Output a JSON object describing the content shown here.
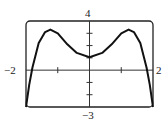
{
  "chart_data": {
    "type": "line",
    "title": "",
    "xlabel": "",
    "ylabel": "",
    "xlim": [
      -2,
      2
    ],
    "ylim": [
      -3,
      4
    ],
    "grid": false,
    "x_tick_step": 1,
    "y_tick_step": 1,
    "axis_labels": {
      "xmin": "−2",
      "xmax": "2",
      "ymax": "4",
      "ymin": "−3"
    },
    "series": [
      {
        "name": "f(x)",
        "x": [
          -2,
          -1.9,
          -1.8,
          -1.6,
          -1.4,
          -1.23,
          -1.0,
          -0.7,
          -0.4,
          0,
          0.4,
          0.7,
          1.0,
          1.23,
          1.4,
          1.6,
          1.8,
          1.9,
          2
        ],
        "y": [
          -3,
          -1.2,
          0.2,
          2.2,
          3.1,
          3.3,
          3.0,
          2.1,
          1.4,
          1.05,
          1.4,
          2.1,
          3.0,
          3.3,
          3.1,
          2.2,
          0.2,
          -1.2,
          -3
        ]
      }
    ],
    "colors": {
      "curve": "#111111",
      "axes": "#333333",
      "frame": "#222222"
    }
  }
}
